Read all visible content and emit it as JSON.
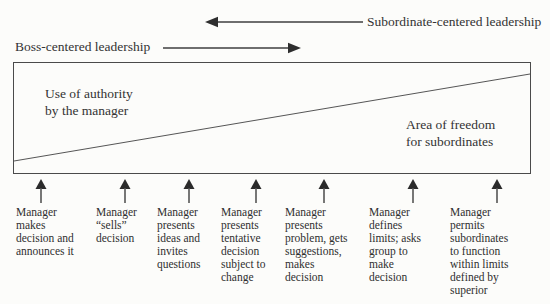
{
  "figure": {
    "top": {
      "subordinate_label": "Subordinate-centered leadership",
      "boss_label": "Boss-centered leadership"
    },
    "box": {
      "authority_label": "Use of authority\nby the manager",
      "freedom_label": "Area of freedom\nfor subordinates"
    },
    "steps": [
      "Manager\nmakes\ndecision and\nannounces it",
      "Manager\n“sells”\ndecision",
      "Manager\npresents\nideas and\ninvites\nquestions",
      "Manager\npresents\ntentative\ndecision\nsubject to\nchange",
      "Manager\npresents\nproblem, gets\nsuggestions,\nmakes\ndecision",
      "Manager\ndefines\nlimits; asks\ngroup to\nmake\ndecision",
      "Manager\npermits\nsubordinates\nto function\nwithin limits\ndefined by\nsuperior"
    ],
    "colors": {
      "line": "#4a4a4a",
      "text": "#2d2d2d",
      "background": "#fcfcfa"
    }
  }
}
